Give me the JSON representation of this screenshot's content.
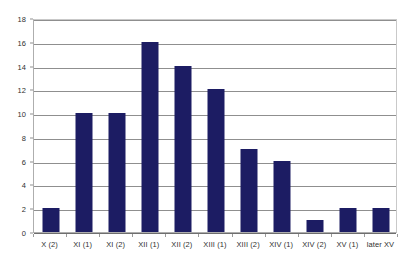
{
  "chart_data": {
    "type": "bar",
    "title": "",
    "subtitle": "",
    "xlabel": "",
    "ylabel": "",
    "categories": [
      "X (2)",
      "XI (1)",
      "XI (2)",
      "XII (1)",
      "XII (2)",
      "XIII (1)",
      "XIII (2)",
      "XIV (1)",
      "XIV (2)",
      "XV (1)",
      "later XV"
    ],
    "values": [
      2,
      10,
      10,
      16,
      14,
      12,
      7,
      6,
      1,
      2,
      2
    ],
    "ylim": [
      0,
      18
    ],
    "ytick_step": 2,
    "yticks": [
      0,
      2,
      4,
      6,
      8,
      10,
      12,
      14,
      16,
      18
    ],
    "ytick_labels": [
      "0",
      "2",
      "4",
      "6",
      "8",
      "10",
      "12",
      "14",
      "16",
      "18"
    ],
    "grid": true,
    "grid_axis": "y",
    "legend": false,
    "legend_position": "none",
    "series": [
      {
        "name": "",
        "values": [
          2,
          10,
          10,
          16,
          14,
          12,
          7,
          6,
          1,
          2,
          2
        ]
      }
    ]
  },
  "style": {
    "bar_color": "#1c1c63",
    "grid_color": "#8f8f8f",
    "axis_color": "#6e6e6e",
    "plot_border_color": "#aeaeae",
    "background": "#ffffff",
    "tick_label_color": "#2f2f2f"
  }
}
